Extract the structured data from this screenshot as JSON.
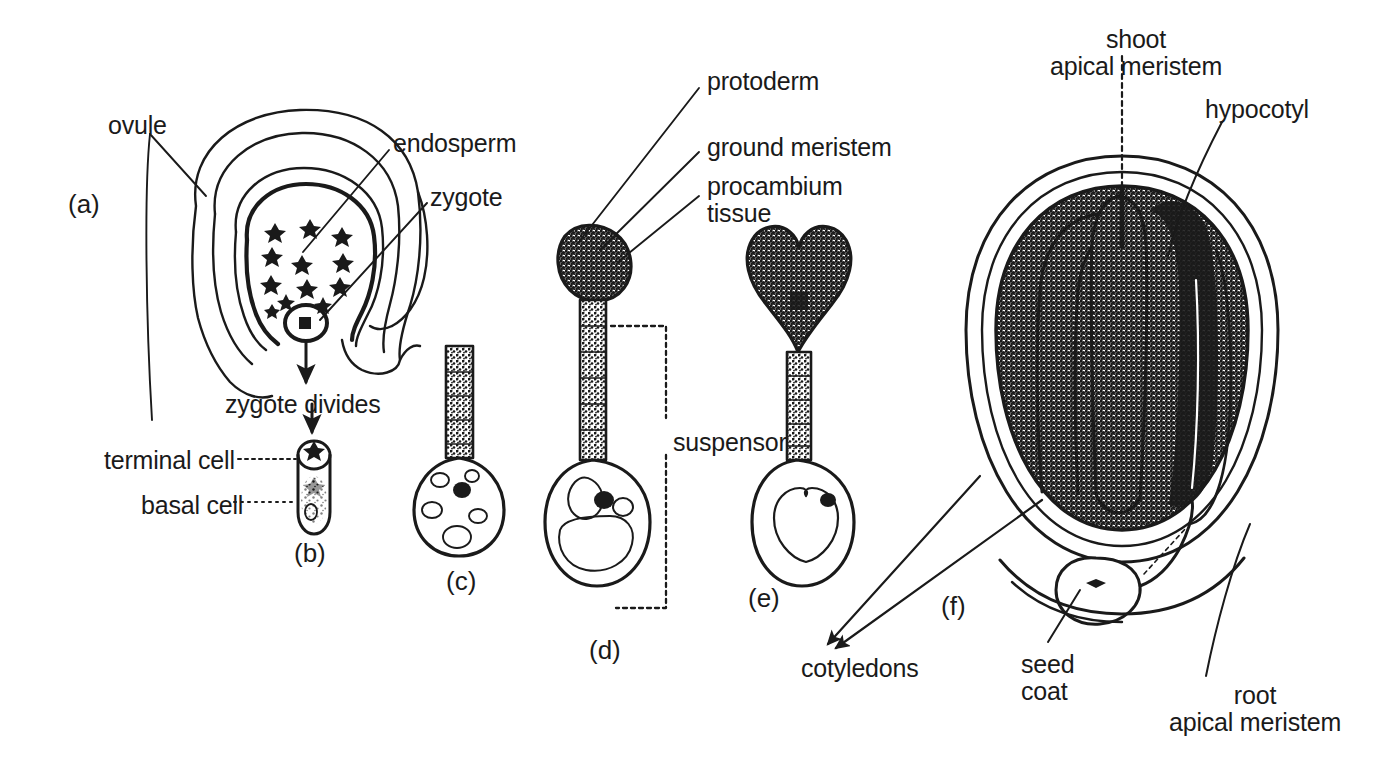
{
  "figure": {
    "background_color": "#ffffff",
    "ink_color": "#1a1a1a"
  },
  "stage_labels": [
    {
      "id": "a",
      "text": "(a)",
      "x": 68,
      "y": 190
    },
    {
      "id": "b",
      "text": "(b)",
      "x": 294,
      "y": 539
    },
    {
      "id": "c",
      "text": "(c)",
      "x": 446,
      "y": 567
    },
    {
      "id": "d",
      "text": "(d)",
      "x": 589,
      "y": 636
    },
    {
      "id": "e",
      "text": "(e)",
      "x": 748,
      "y": 584
    },
    {
      "id": "f",
      "text": "(f)",
      "x": 941,
      "y": 592
    }
  ],
  "labels": [
    {
      "name": "ovule",
      "text": "ovule",
      "x": 108,
      "y": 112,
      "align": "left"
    },
    {
      "name": "endosperm",
      "text": "endosperm",
      "x": 393,
      "y": 130,
      "align": "left"
    },
    {
      "name": "zygote",
      "text": "zygote",
      "x": 430,
      "y": 184,
      "align": "left"
    },
    {
      "name": "zygote-divides",
      "text": "zygote divides",
      "x": 225,
      "y": 391,
      "align": "left"
    },
    {
      "name": "terminal-cell",
      "text": "terminal cell",
      "x": 104,
      "y": 447,
      "align": "left"
    },
    {
      "name": "basal-cell",
      "text": "basal cell",
      "x": 141,
      "y": 492,
      "align": "left"
    },
    {
      "name": "protoderm",
      "text": "protoderm",
      "x": 707,
      "y": 68,
      "align": "left"
    },
    {
      "name": "ground-meristem",
      "text": "ground meristem",
      "x": 707,
      "y": 134,
      "align": "left"
    },
    {
      "name": "procambium-tissue",
      "text": "procambium\ntissue",
      "x": 707,
      "y": 173,
      "align": "left"
    },
    {
      "name": "suspensor",
      "text": "suspensor",
      "x": 673,
      "y": 429,
      "align": "left"
    },
    {
      "name": "cotyledons",
      "text": "cotyledons",
      "x": 801,
      "y": 655,
      "align": "left"
    },
    {
      "name": "seed-coat",
      "text": "seed\ncoat",
      "x": 1021,
      "y": 651,
      "align": "left"
    },
    {
      "name": "shoot-apical-meristem",
      "text": "shoot\napical meristem",
      "x": 1042,
      "y": 26,
      "align": "left"
    },
    {
      "name": "hypocotyl",
      "text": "hypocotyl",
      "x": 1205,
      "y": 96,
      "align": "left"
    },
    {
      "name": "root-apical-meristem",
      "text": "root\napical meristem",
      "x": 1150,
      "y": 682,
      "align": "left"
    }
  ]
}
